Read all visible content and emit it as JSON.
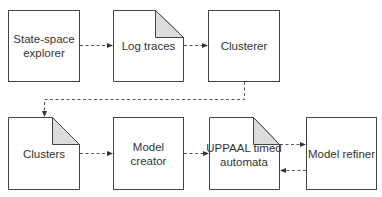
{
  "diagram": {
    "nodes": [
      {
        "id": "explorer",
        "label": "State-space explorer",
        "shape": "box"
      },
      {
        "id": "log_traces",
        "label": "Log traces",
        "shape": "document"
      },
      {
        "id": "clusterer",
        "label": "Clusterer",
        "shape": "box"
      },
      {
        "id": "clusters",
        "label": "Clusters",
        "shape": "document"
      },
      {
        "id": "model_creator",
        "label": "Model creator",
        "shape": "box"
      },
      {
        "id": "uppaal",
        "label": "UPPAAL timed automata",
        "shape": "document"
      },
      {
        "id": "model_refiner",
        "label": "Model refiner",
        "shape": "box"
      }
    ],
    "edges": [
      {
        "from": "explorer",
        "to": "log_traces",
        "style": "dashed"
      },
      {
        "from": "log_traces",
        "to": "clusterer",
        "style": "dashed"
      },
      {
        "from": "clusterer",
        "to": "clusters",
        "style": "dashed"
      },
      {
        "from": "clusters",
        "to": "model_creator",
        "style": "dashed"
      },
      {
        "from": "model_creator",
        "to": "uppaal",
        "style": "dashed"
      },
      {
        "from": "uppaal",
        "to": "model_refiner",
        "style": "dashed"
      },
      {
        "from": "model_refiner",
        "to": "uppaal",
        "style": "dashed"
      }
    ],
    "colors": {
      "stroke": "#333333",
      "fold_fill": "#dcdcdc",
      "text": "#333333"
    }
  }
}
